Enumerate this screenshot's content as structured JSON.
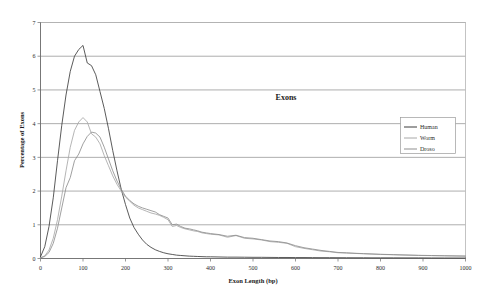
{
  "chart_data": {
    "type": "line",
    "title": "Exons",
    "xlabel": "Exon Length (bp)",
    "ylabel": "Percentage of Exons",
    "xlim": [
      0,
      1000
    ],
    "ylim": [
      0,
      7
    ],
    "xticks": [
      0,
      100,
      200,
      300,
      400,
      500,
      600,
      700,
      800,
      900,
      1000
    ],
    "yticks": [
      0,
      1,
      2,
      3,
      4,
      5,
      6,
      7
    ],
    "grid": "horizontal",
    "legend_position": "right",
    "colors": {
      "human": "#3d3d3d",
      "worm": "#a8a8a8",
      "droso": "#8f8f8f"
    },
    "x": [
      0,
      10,
      20,
      30,
      40,
      50,
      60,
      70,
      80,
      90,
      100,
      110,
      120,
      130,
      140,
      150,
      160,
      170,
      180,
      190,
      200,
      210,
      220,
      230,
      240,
      250,
      260,
      270,
      280,
      290,
      300,
      310,
      320,
      330,
      340,
      350,
      360,
      370,
      380,
      390,
      400,
      420,
      440,
      460,
      480,
      500,
      520,
      540,
      560,
      580,
      600,
      620,
      640,
      660,
      680,
      700,
      720,
      740,
      760,
      780,
      800,
      830,
      860,
      890,
      920,
      950,
      1000
    ],
    "series": [
      {
        "name": "Human",
        "values": [
          0.05,
          0.35,
          0.95,
          1.8,
          2.9,
          3.95,
          4.85,
          5.55,
          6.0,
          6.2,
          6.32,
          5.8,
          5.72,
          5.45,
          4.95,
          4.45,
          3.85,
          3.2,
          2.6,
          2.05,
          1.6,
          1.2,
          0.92,
          0.72,
          0.55,
          0.42,
          0.33,
          0.26,
          0.21,
          0.17,
          0.14,
          0.12,
          0.1,
          0.09,
          0.08,
          0.07,
          0.065,
          0.06,
          0.055,
          0.05,
          0.05,
          0.045,
          0.04,
          0.04,
          0.038,
          0.035,
          0.035,
          0.032,
          0.03,
          0.03,
          0.028,
          0.028,
          0.026,
          0.025,
          0.025,
          0.024,
          0.023,
          0.022,
          0.022,
          0.02,
          0.02,
          0.02,
          0.018,
          0.018,
          0.016,
          0.015,
          0.014
        ]
      },
      {
        "name": "Worm",
        "values": [
          0.02,
          0.08,
          0.25,
          0.6,
          1.15,
          1.85,
          2.6,
          3.3,
          3.8,
          4.05,
          4.18,
          4.05,
          3.7,
          3.6,
          3.4,
          3.05,
          2.75,
          2.45,
          2.2,
          2.0,
          1.82,
          1.7,
          1.58,
          1.5,
          1.45,
          1.4,
          1.35,
          1.32,
          1.28,
          1.22,
          1.15,
          0.95,
          0.98,
          0.92,
          0.88,
          0.85,
          0.82,
          0.8,
          0.76,
          0.74,
          0.72,
          0.7,
          0.63,
          0.68,
          0.6,
          0.58,
          0.55,
          0.5,
          0.48,
          0.45,
          0.35,
          0.3,
          0.26,
          0.22,
          0.2,
          0.17,
          0.16,
          0.15,
          0.14,
          0.13,
          0.12,
          0.11,
          0.1,
          0.09,
          0.085,
          0.08,
          0.07
        ]
      },
      {
        "name": "Droso",
        "values": [
          0.02,
          0.06,
          0.18,
          0.45,
          0.9,
          1.5,
          2.1,
          2.4,
          2.9,
          3.1,
          3.4,
          3.62,
          3.75,
          3.72,
          3.6,
          3.3,
          2.95,
          2.6,
          2.3,
          2.05,
          1.85,
          1.72,
          1.62,
          1.55,
          1.5,
          1.46,
          1.42,
          1.38,
          1.3,
          1.25,
          1.2,
          1.0,
          1.02,
          0.95,
          0.9,
          0.88,
          0.85,
          0.82,
          0.78,
          0.76,
          0.74,
          0.71,
          0.66,
          0.69,
          0.62,
          0.6,
          0.56,
          0.52,
          0.5,
          0.46,
          0.38,
          0.32,
          0.28,
          0.24,
          0.21,
          0.18,
          0.17,
          0.155,
          0.145,
          0.135,
          0.125,
          0.115,
          0.105,
          0.095,
          0.088,
          0.082,
          0.072
        ]
      }
    ]
  },
  "legend": {
    "items": [
      {
        "label": "Human",
        "color": "#3d3d3d"
      },
      {
        "label": "Worm",
        "color": "#a8a8a8"
      },
      {
        "label": "Droso",
        "color": "#8f8f8f"
      }
    ]
  }
}
